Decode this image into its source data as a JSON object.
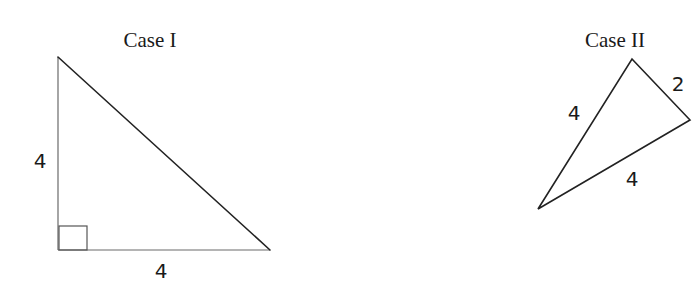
{
  "figures": [
    {
      "id": "case-1",
      "title": "Case I",
      "shape": "right-triangle",
      "vertices": [
        [
          58,
          57
        ],
        [
          58,
          250
        ],
        [
          270,
          250
        ]
      ],
      "right_angle_marker": true,
      "side_labels": [
        {
          "side": "left-vertical",
          "text": "4"
        },
        {
          "side": "bottom-horizontal",
          "text": "4"
        }
      ]
    },
    {
      "id": "case-2",
      "title": "Case II",
      "shape": "triangle",
      "vertices": [
        [
          632,
          59
        ],
        [
          690,
          120
        ],
        [
          538,
          209
        ]
      ],
      "right_angle_marker": false,
      "side_labels": [
        {
          "side": "upper-left",
          "text": "4"
        },
        {
          "side": "upper-right",
          "text": "2"
        },
        {
          "side": "lower",
          "text": "4"
        }
      ]
    }
  ],
  "colors": {
    "stroke": "#222222",
    "text": "#1a1a1a",
    "background": "#ffffff"
  }
}
